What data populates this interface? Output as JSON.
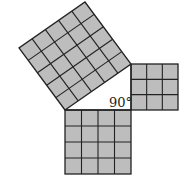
{
  "diagram": {
    "title": "",
    "type": "pythagorean-theorem-squares",
    "angle_label": "90°",
    "colors": {
      "fill": "#bdbdbd",
      "stroke": "#222222",
      "background": "#ffffff"
    },
    "squares": [
      {
        "name": "hypotenuse-square",
        "grid": 5,
        "cells": 25
      },
      {
        "name": "vertical-leg-square",
        "grid": 3,
        "cells": 9
      },
      {
        "name": "horizontal-leg-square",
        "grid": 4,
        "cells": 16
      }
    ]
  }
}
